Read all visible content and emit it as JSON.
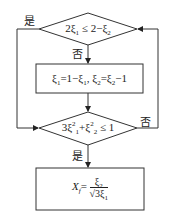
{
  "diagram": {
    "type": "flowchart",
    "nodes": [
      {
        "id": "cond1",
        "shape": "diamond",
        "text": "2ξ₁ ≤ 2−ξ₂",
        "parts": {
          "lhs_coef": "2",
          "var1": "ξ",
          "sub1": "1",
          "op": "≤",
          "rhs": "2−",
          "var2": "ξ",
          "sub2": "2"
        }
      },
      {
        "id": "assign",
        "shape": "rectangle",
        "text": "ξ₁=1−ξ₁, ξ₂=ξ₂−1",
        "parts": {
          "a": "ξ",
          "a_sub": "1",
          "eq1": "=1−",
          "b": "ξ",
          "b_sub": "1",
          "sep": ", ",
          "c": "ξ",
          "c_sub": "2",
          "eq2": "=",
          "d": "ξ",
          "d_sub": "2",
          "tail": "−1"
        }
      },
      {
        "id": "cond2",
        "shape": "diamond",
        "text": "3ξ₁² + ξ₂² ≤ 1",
        "parts": {
          "coef": "3",
          "v1": "ξ",
          "s1": "1",
          "p1": "2",
          "plus": "+",
          "v2": "ξ",
          "s2": "2",
          "p2": "2",
          "op": "≤",
          "rhs": "1"
        }
      },
      {
        "id": "result",
        "shape": "rectangle",
        "text": "X_f = ξ₂ / √(3ξ₁)",
        "parts": {
          "lhs": "X",
          "lhs_sub": "f",
          "eq": "=",
          "num": "ξ",
          "num_sub": "2",
          "den_root": "√",
          "den": "3ξ",
          "den_sub": "1"
        }
      }
    ],
    "edges": [
      {
        "from": "cond1",
        "to": "cond2",
        "label": "是"
      },
      {
        "from": "cond1",
        "to": "assign",
        "label": "否"
      },
      {
        "from": "assign",
        "to": "cond2",
        "label": ""
      },
      {
        "from": "cond2",
        "to": "cond1",
        "label": "否"
      },
      {
        "from": "cond2",
        "to": "result",
        "label": "是"
      }
    ],
    "labels": {
      "yes_top": "是",
      "no_top": "否",
      "no_right": "否",
      "yes_bottom": "是"
    }
  }
}
